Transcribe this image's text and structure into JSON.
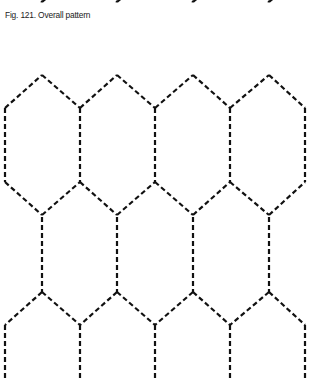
{
  "figure": {
    "caption": "Fig. 121. Overall pattern",
    "line_style": "dashed",
    "line_color": "#111111",
    "pattern": "elongated hexagons in offset rows"
  }
}
